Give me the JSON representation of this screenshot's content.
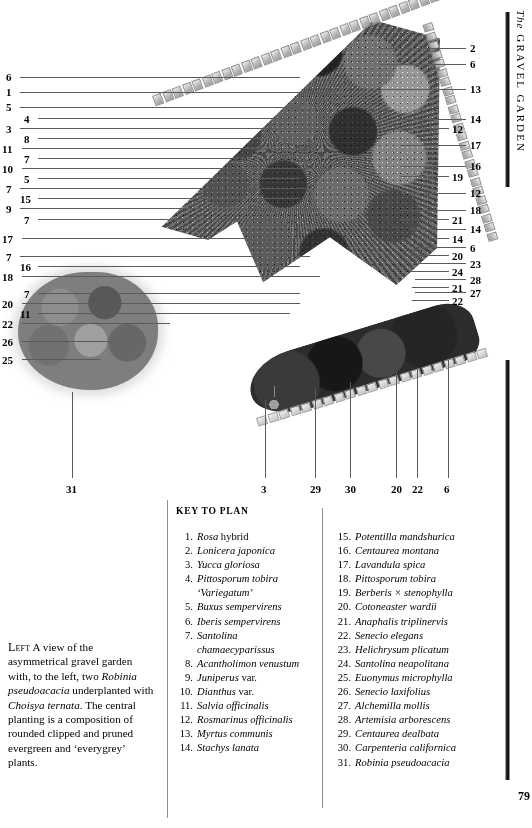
{
  "page": {
    "folio": "79",
    "running_head_prefix": "The",
    "running_head": "GRAVEL GARDEN"
  },
  "figure": {
    "name": "gravel-garden-plan",
    "labels_left": [
      {
        "n": "6",
        "x": 6,
        "y": 72,
        "line_x1": 20,
        "line_x2": 300,
        "line_y": 77
      },
      {
        "n": "1",
        "x": 6,
        "y": 87,
        "line_x1": 20,
        "line_x2": 330,
        "line_y": 92
      },
      {
        "n": "5",
        "x": 6,
        "y": 102,
        "line_x1": 20,
        "line_x2": 300,
        "line_y": 107
      },
      {
        "n": "4",
        "x": 24,
        "y": 114,
        "line_x1": 38,
        "line_x2": 300,
        "line_y": 118
      },
      {
        "n": "3",
        "x": 6,
        "y": 124,
        "line_x1": 20,
        "line_x2": 320,
        "line_y": 128
      },
      {
        "n": "8",
        "x": 24,
        "y": 134,
        "line_x1": 38,
        "line_x2": 310,
        "line_y": 138
      },
      {
        "n": "11",
        "x": 2,
        "y": 144,
        "line_x1": 22,
        "line_x2": 320,
        "line_y": 148
      },
      {
        "n": "7",
        "x": 24,
        "y": 154,
        "line_x1": 38,
        "line_x2": 300,
        "line_y": 158
      },
      {
        "n": "10",
        "x": 2,
        "y": 164,
        "line_x1": 22,
        "line_x2": 330,
        "line_y": 168
      },
      {
        "n": "5",
        "x": 24,
        "y": 174,
        "line_x1": 38,
        "line_x2": 300,
        "line_y": 178
      },
      {
        "n": "7",
        "x": 6,
        "y": 184,
        "line_x1": 20,
        "line_x2": 310,
        "line_y": 188
      },
      {
        "n": "15",
        "x": 20,
        "y": 194,
        "line_x1": 38,
        "line_x2": 300,
        "line_y": 198
      },
      {
        "n": "9",
        "x": 6,
        "y": 204,
        "line_x1": 20,
        "line_x2": 320,
        "line_y": 208
      },
      {
        "n": "7",
        "x": 24,
        "y": 215,
        "line_x1": 38,
        "line_x2": 300,
        "line_y": 219
      },
      {
        "n": "17",
        "x": 2,
        "y": 234,
        "line_x1": 22,
        "line_x2": 300,
        "line_y": 238
      },
      {
        "n": "7",
        "x": 6,
        "y": 252,
        "line_x1": 20,
        "line_x2": 310,
        "line_y": 256
      },
      {
        "n": "16",
        "x": 20,
        "y": 262,
        "line_x1": 38,
        "line_x2": 300,
        "line_y": 266
      },
      {
        "n": "18",
        "x": 2,
        "y": 272,
        "line_x1": 22,
        "line_x2": 320,
        "line_y": 276
      },
      {
        "n": "7",
        "x": 24,
        "y": 289,
        "line_x1": 38,
        "line_x2": 300,
        "line_y": 293
      },
      {
        "n": "20",
        "x": 2,
        "y": 299,
        "line_x1": 22,
        "line_x2": 300,
        "line_y": 303
      },
      {
        "n": "11",
        "x": 20,
        "y": 309,
        "line_x1": 38,
        "line_x2": 290,
        "line_y": 313
      },
      {
        "n": "22",
        "x": 2,
        "y": 319,
        "line_x1": 22,
        "line_x2": 170,
        "line_y": 323
      },
      {
        "n": "26",
        "x": 2,
        "y": 337,
        "line_x1": 22,
        "line_x2": 110,
        "line_y": 341
      },
      {
        "n": "25",
        "x": 2,
        "y": 355,
        "line_x1": 22,
        "line_x2": 100,
        "line_y": 359
      }
    ],
    "labels_right": [
      {
        "n": "2",
        "x": 470,
        "y": 43,
        "line_x1": 380,
        "line_x2": 466,
        "line_y": 48
      },
      {
        "n": "6",
        "x": 470,
        "y": 59,
        "line_x1": 380,
        "line_x2": 466,
        "line_y": 64
      },
      {
        "n": "13",
        "x": 470,
        "y": 84,
        "line_x1": 380,
        "line_x2": 466,
        "line_y": 89
      },
      {
        "n": "14",
        "x": 470,
        "y": 114,
        "line_x1": 400,
        "line_x2": 466,
        "line_y": 119
      },
      {
        "n": "12",
        "x": 452,
        "y": 124,
        "line_x1": 400,
        "line_x2": 449,
        "line_y": 128
      },
      {
        "n": "17",
        "x": 470,
        "y": 140,
        "line_x1": 400,
        "line_x2": 466,
        "line_y": 145
      },
      {
        "n": "16",
        "x": 470,
        "y": 161,
        "line_x1": 400,
        "line_x2": 466,
        "line_y": 166
      },
      {
        "n": "19",
        "x": 452,
        "y": 172,
        "line_x1": 400,
        "line_x2": 449,
        "line_y": 176
      },
      {
        "n": "12",
        "x": 470,
        "y": 188,
        "line_x1": 400,
        "line_x2": 466,
        "line_y": 193
      },
      {
        "n": "18",
        "x": 470,
        "y": 205,
        "line_x1": 400,
        "line_x2": 466,
        "line_y": 210
      },
      {
        "n": "21",
        "x": 452,
        "y": 215,
        "line_x1": 400,
        "line_x2": 449,
        "line_y": 219
      },
      {
        "n": "14",
        "x": 470,
        "y": 224,
        "line_x1": 410,
        "line_x2": 466,
        "line_y": 229
      },
      {
        "n": "14",
        "x": 452,
        "y": 234,
        "line_x1": 410,
        "line_x2": 449,
        "line_y": 238
      },
      {
        "n": "6",
        "x": 470,
        "y": 243,
        "line_x1": 415,
        "line_x2": 466,
        "line_y": 247
      },
      {
        "n": "20",
        "x": 452,
        "y": 251,
        "line_x1": 410,
        "line_x2": 449,
        "line_y": 255
      },
      {
        "n": "23",
        "x": 470,
        "y": 259,
        "line_x1": 415,
        "line_x2": 466,
        "line_y": 263
      },
      {
        "n": "24",
        "x": 452,
        "y": 267,
        "line_x1": 410,
        "line_x2": 449,
        "line_y": 271
      },
      {
        "n": "28",
        "x": 470,
        "y": 275,
        "line_x1": 415,
        "line_x2": 466,
        "line_y": 279
      },
      {
        "n": "21",
        "x": 452,
        "y": 283,
        "line_x1": 412,
        "line_x2": 449,
        "line_y": 287
      },
      {
        "n": "27",
        "x": 470,
        "y": 288,
        "line_x1": 415,
        "line_x2": 466,
        "line_y": 292
      },
      {
        "n": "22",
        "x": 452,
        "y": 296,
        "line_x1": 412,
        "line_x2": 449,
        "line_y": 300
      }
    ],
    "labels_bottom": [
      {
        "n": "31",
        "x": 66,
        "y": 484,
        "tick_x": 72,
        "tick_y1": 392,
        "tick_y2": 478
      },
      {
        "n": "3",
        "x": 261,
        "y": 484,
        "tick_x": 265,
        "tick_y1": 400,
        "tick_y2": 478
      },
      {
        "n": "29",
        "x": 310,
        "y": 484,
        "tick_x": 315,
        "tick_y1": 388,
        "tick_y2": 478
      },
      {
        "n": "30",
        "x": 345,
        "y": 484,
        "tick_x": 350,
        "tick_y1": 382,
        "tick_y2": 478
      },
      {
        "n": "20",
        "x": 391,
        "y": 484,
        "tick_x": 396,
        "tick_y1": 372,
        "tick_y2": 478
      },
      {
        "n": "22",
        "x": 412,
        "y": 484,
        "tick_x": 417,
        "tick_y1": 368,
        "tick_y2": 478
      },
      {
        "n": "6",
        "x": 444,
        "y": 484,
        "tick_x": 448,
        "tick_y1": 360,
        "tick_y2": 478
      }
    ]
  },
  "caption": {
    "lead": "Left",
    "text_before_italic1": " A view of the asymmetrical gravel garden with, to the left, two ",
    "italic1": "Robinia pseudoacacia",
    "text_mid": " underplanted with ",
    "italic2": "Choisya ternata",
    "text_after": ". The central planting is a composition of rounded clipped and pruned evergreen and ‘everygrey’ plants."
  },
  "key": {
    "heading": "KEY TO PLAN",
    "column_left": [
      {
        "n": "1.",
        "italic": "Rosa",
        "roman": " hybrid"
      },
      {
        "n": "2.",
        "italic": "Lonicera japonica",
        "roman": ""
      },
      {
        "n": "3.",
        "italic": "Yucca gloriosa",
        "roman": ""
      },
      {
        "n": "4.",
        "italic": "Pittosporum tobira",
        "roman": "",
        "cont": "‘Variegatum’"
      },
      {
        "n": "5.",
        "italic": "Buxus sempervirens",
        "roman": ""
      },
      {
        "n": "6.",
        "italic": "Iberis sempervirens",
        "roman": ""
      },
      {
        "n": "7.",
        "italic": "Santolina",
        "roman": "",
        "cont": "chamaecyparissus"
      },
      {
        "n": "8.",
        "italic": "Acantholimon venustum",
        "roman": ""
      },
      {
        "n": "9.",
        "italic": "Juniperus",
        "roman": " var."
      },
      {
        "n": "10.",
        "italic": "Dianthus",
        "roman": " var."
      },
      {
        "n": "11.",
        "italic": "Salvia officinalis",
        "roman": ""
      },
      {
        "n": "12.",
        "italic": "Rosmarinus officinalis",
        "roman": ""
      },
      {
        "n": "13.",
        "italic": "Myrtus communis",
        "roman": ""
      },
      {
        "n": "14.",
        "italic": "Stachys lanata",
        "roman": ""
      }
    ],
    "column_right": [
      {
        "n": "15.",
        "italic": "Potentilla mandshurica",
        "roman": ""
      },
      {
        "n": "16.",
        "italic": "Centaurea montana",
        "roman": ""
      },
      {
        "n": "17.",
        "italic": "Lavandula spica",
        "roman": ""
      },
      {
        "n": "18.",
        "italic": "Pittosporum tobira",
        "roman": ""
      },
      {
        "n": "19.",
        "italic": "Berberis × stenophylla",
        "roman": ""
      },
      {
        "n": "20.",
        "italic": "Cotoneaster wardii",
        "roman": ""
      },
      {
        "n": "21.",
        "italic": "Anaphalis triplinervis",
        "roman": ""
      },
      {
        "n": "22.",
        "italic": "Senecio elegans",
        "roman": ""
      },
      {
        "n": "23.",
        "italic": "Helichrysum plicatum",
        "roman": ""
      },
      {
        "n": "24.",
        "italic": "Santolina neapolitana",
        "roman": ""
      },
      {
        "n": "25.",
        "italic": "Euonymus microphylla",
        "roman": ""
      },
      {
        "n": "26.",
        "italic": "Senecio laxifolius",
        "roman": ""
      },
      {
        "n": "27.",
        "italic": "Alchemilla mollis",
        "roman": ""
      },
      {
        "n": "28.",
        "italic": "Artemisia arborescens",
        "roman": ""
      },
      {
        "n": "29.",
        "italic": "Centaurea dealbata",
        "roman": ""
      },
      {
        "n": "30.",
        "italic": "Carpenteria californica",
        "roman": ""
      },
      {
        "n": "31.",
        "italic": "Robinia pseudoacacia",
        "roman": ""
      }
    ]
  },
  "colors": {
    "ink": "#000000",
    "leader": "#5a5a5a",
    "rule": "#8e8e8e",
    "spine": "#111111"
  }
}
